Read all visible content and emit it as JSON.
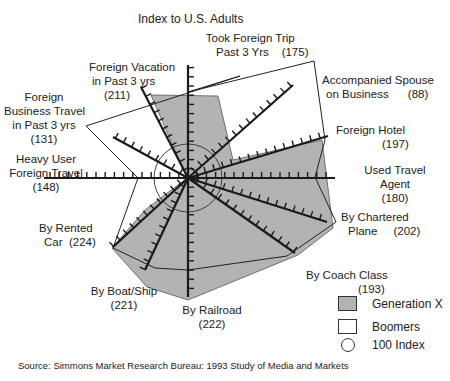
{
  "chart_data": {
    "type": "radar",
    "title": "Index to U.S. Adults",
    "categories": [
      "Took Foreign Trip Past 3 Yrs",
      "Accompanied Spouse on Business",
      "Foreign Hotel",
      "Used Travel Agent",
      "By Chartered Plane",
      "By Coach Class",
      "By Railroad",
      "By Boat/Ship",
      "By Rented Car",
      "Heavy User Foreign Travel",
      "Foreign Business Travel in Past 3 yrs",
      "Foreign Vacation in Past 3 yrs"
    ],
    "label_values": [
      175,
      88,
      197,
      180,
      202,
      193,
      222,
      221,
      224,
      148,
      131,
      211
    ],
    "series": [
      {
        "name": "Generation X",
        "style": "filled gray",
        "values": [
          175,
          88,
          197,
          180,
          202,
          193,
          222,
          221,
          224,
          148,
          131,
          211
        ]
      },
      {
        "name": "Boomers",
        "style": "outline",
        "values": [
          160,
          260,
          205,
          180,
          195,
          190,
          175,
          150,
          190,
          165,
          220,
          180
        ]
      }
    ],
    "reference": {
      "name": "100 Index",
      "value": 100,
      "style": "circle"
    },
    "legend_position": "bottom-right",
    "grid": false
  },
  "title": "Index to U.S. Adults",
  "labels": {
    "took_trip_1": "Took Foreign Trip",
    "took_trip_2": "Past 3 Yrs",
    "took_trip_val": "(175)",
    "spouse_1": "Accompanied Spouse",
    "spouse_2": "on Business",
    "spouse_val": "(88)",
    "hotel_1": "Foreign Hotel",
    "hotel_val": "(197)",
    "agent_1": "Used Travel",
    "agent_2": "Agent",
    "agent_val": "(180)",
    "charter_1": "By Chartered",
    "charter_2": "Plane",
    "charter_val": "(202)",
    "coach_1": "By Coach Class",
    "coach_val": "(193)",
    "rail_1": "By Railroad",
    "rail_val": "(222)",
    "boat_1": "By Boat/Ship",
    "boat_val": "(221)",
    "car_1": "By Rented",
    "car_2": "Car",
    "car_val": "(224)",
    "heavy_1": "Heavy User",
    "heavy_2": "Foreign Travel",
    "heavy_val": "(148)",
    "biz_1": "Foreign",
    "biz_2": "Business Travel",
    "biz_3": "in Past 3 yrs",
    "biz_val": "(131)",
    "vac_1": "Foreign Vacation",
    "vac_2": "in Past 3 yrs",
    "vac_val": "(211)"
  },
  "legend": {
    "genx": "Generation X",
    "boomers": "Boomers",
    "index": "100 Index"
  },
  "colors": {
    "genx_fill": "#b3b3b3",
    "line": "#222222"
  },
  "source": "Source: Simmons Market Research Bureau: 1993 Study of Media and Markets"
}
